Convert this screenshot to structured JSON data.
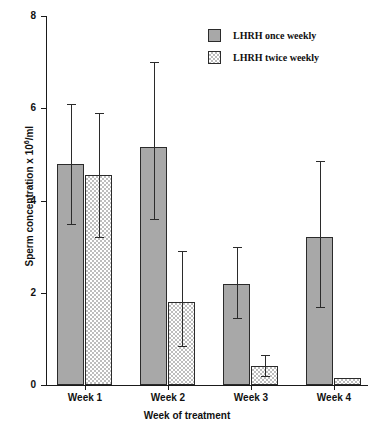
{
  "chart_data": {
    "type": "bar",
    "title": "",
    "xlabel": "Week of treatment",
    "ylabel": "Sperm concentration  x  10⁶/ml",
    "ylabel_prefix": "Sperm concentration  x  10",
    "ylabel_exponent": "6",
    "ylabel_suffix": "/ml",
    "categories": [
      "Week 1",
      "Week 2",
      "Week 3",
      "Week 4"
    ],
    "ylim": [
      0,
      8
    ],
    "yticks": [
      0,
      2,
      4,
      6,
      8
    ],
    "ytick_labels": [
      "0",
      "2",
      "4",
      "6",
      "8"
    ],
    "grid": false,
    "legend_position": "top-right",
    "series": [
      {
        "name": "LHRH once weekly",
        "fill": "solid",
        "color": "#a8a8a8",
        "values": [
          4.8,
          5.15,
          2.2,
          3.2
        ],
        "error_low": [
          3.5,
          3.6,
          1.45,
          1.7
        ],
        "error_high": [
          6.1,
          7.0,
          3.0,
          4.85
        ]
      },
      {
        "name": "LHRH twice weekly",
        "fill": "stipple",
        "color": "#ffffff",
        "values": [
          4.55,
          1.8,
          0.42,
          0.15
        ],
        "error_low": [
          3.2,
          0.85,
          0.2,
          null
        ],
        "error_high": [
          5.9,
          2.9,
          0.65,
          null
        ]
      }
    ]
  },
  "legend": {
    "items": [
      {
        "label": "LHRH once weekly",
        "fill": "solid"
      },
      {
        "label": "LHRH twice weekly",
        "fill": "stipple"
      }
    ]
  },
  "colors": {
    "series_one": "#a8a8a8",
    "series_two": "#ffffff",
    "axis": "#1a1a1a",
    "outline": "#2b2b2b",
    "background": "#ffffff"
  }
}
